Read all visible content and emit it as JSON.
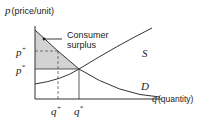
{
  "diagram": {
    "y_axis_label_symbol": "p",
    "y_axis_label_text": "(price/unit)",
    "x_axis_label_symbol": "q",
    "x_axis_label_text": "(quantity)",
    "supply_label": "S",
    "demand_label": "D",
    "annotation_line1": "Consumer",
    "annotation_line2": "surplus",
    "p_plus_label": "p",
    "p_plus_sup": "+",
    "p_star_label": "p",
    "p_star_sup": "*",
    "q_plus_label": "q",
    "q_plus_sup": "+",
    "q_star_label": "q",
    "q_star_sup": "*",
    "colors": {
      "axis": "#333333",
      "curve": "#333333",
      "shaded": "#d3d3d3",
      "dashed": "#555555",
      "text": "#222222"
    }
  }
}
